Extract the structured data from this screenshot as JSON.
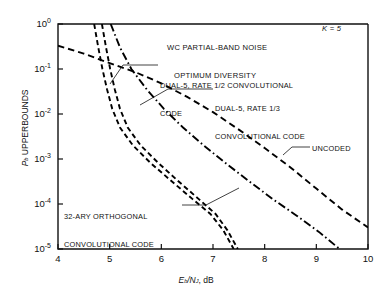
{
  "chart_data": {
    "type": "line",
    "title": "WC PARTIAL-BAND NOISE OPTIMUM DIVERSITY",
    "title_line1": "WC PARTIAL-BAND NOISE",
    "title_line2": "OPTIMUM DIVERSITY",
    "parameter_label": "K = 5",
    "xlabel": "Eb/NJ, dB",
    "xlabel_main": "E",
    "xlabel_sub1": "b",
    "xlabel_slash": "/N",
    "xlabel_sub2": "J",
    "xlabel_units": ", dB",
    "ylabel": "Pb UPPERBOUNDS",
    "ylabel_main": "P",
    "ylabel_sub": "b",
    "ylabel_rest": " UPPERBOUNDS",
    "xlim": [
      4,
      10
    ],
    "ylim": [
      1e-05,
      1
    ],
    "yscale": "log",
    "grid": false,
    "legend_position": "inline-annotations",
    "xticks": [
      "4",
      "5",
      "6",
      "7",
      "8",
      "9",
      "10"
    ],
    "yticks": [
      "10^0",
      "10^-1",
      "10^-2",
      "10^-3",
      "10^-4",
      "10^-5"
    ],
    "ytick_exponents": [
      "0",
      "-1",
      "-2",
      "-3",
      "-4",
      "-5"
    ],
    "ytick_mantissa": "10",
    "series": [
      {
        "name": "32-ARY ORTHOGONAL CONVOLUTIONAL CODE",
        "style": "dashed",
        "color": "#000000",
        "points": [
          [
            4.7,
            1.0
          ],
          [
            4.78,
            0.3
          ],
          [
            4.86,
            0.1
          ],
          [
            4.95,
            0.035
          ],
          [
            5.05,
            0.013
          ],
          [
            5.2,
            0.005
          ],
          [
            5.45,
            0.002
          ],
          [
            5.8,
            0.0008
          ],
          [
            6.2,
            0.00032
          ],
          [
            6.6,
            0.00013
          ],
          [
            6.95,
            6e-05
          ],
          [
            7.2,
            2.6e-05
          ],
          [
            7.4,
            1e-05
          ]
        ]
      },
      {
        "name": "DUAL-5, RATE 1/2 CONVOLUTIONAL CODE",
        "style": "dashed",
        "color": "#000000",
        "points": [
          [
            4.85,
            1.0
          ],
          [
            4.93,
            0.3
          ],
          [
            5.01,
            0.1
          ],
          [
            5.1,
            0.035
          ],
          [
            5.2,
            0.013
          ],
          [
            5.35,
            0.005
          ],
          [
            5.6,
            0.002
          ],
          [
            5.95,
            0.0008
          ],
          [
            6.33,
            0.00032
          ],
          [
            6.72,
            0.00013
          ],
          [
            7.05,
            6e-05
          ],
          [
            7.28,
            2.6e-05
          ],
          [
            7.48,
            1e-05
          ]
        ]
      },
      {
        "name": "DUAL-5, RATE 1/3 CONVOLUTIONAL CODE",
        "style": "dashdot",
        "color": "#000000",
        "points": [
          [
            5.02,
            1.0
          ],
          [
            5.2,
            0.3
          ],
          [
            5.42,
            0.1
          ],
          [
            5.72,
            0.035
          ],
          [
            6.05,
            0.013
          ],
          [
            6.42,
            0.005
          ],
          [
            6.82,
            0.002
          ],
          [
            7.25,
            0.0008
          ],
          [
            7.7,
            0.00032
          ],
          [
            8.15,
            0.00013
          ],
          [
            8.62,
            5.5e-05
          ],
          [
            9.05,
            2.4e-05
          ],
          [
            9.45,
            1e-05
          ]
        ]
      },
      {
        "name": "UNCODED",
        "style": "dashed-long",
        "color": "#000000",
        "points": [
          [
            4.0,
            0.33
          ],
          [
            4.5,
            0.22
          ],
          [
            5.0,
            0.135
          ],
          [
            5.5,
            0.085
          ],
          [
            6.0,
            0.048
          ],
          [
            6.5,
            0.024
          ],
          [
            7.0,
            0.011
          ],
          [
            7.5,
            0.0045
          ],
          [
            8.0,
            0.00175
          ],
          [
            8.5,
            0.00065
          ],
          [
            9.0,
            0.00022
          ],
          [
            9.5,
            7.5e-05
          ],
          [
            10.0,
            3e-05
          ]
        ]
      }
    ],
    "annotations": [
      {
        "id": "ann-rate-half",
        "line1": "DUAL-5, RATE 1/2 CONVOLUTIONAL",
        "line2": "CODE"
      },
      {
        "id": "ann-rate-third",
        "line1": "DUAL-5, RATE 1/3",
        "line2": "CONVOLUTIONAL CODE"
      },
      {
        "id": "ann-uncoded",
        "line1": "UNCODED",
        "line2": ""
      },
      {
        "id": "ann-32ary",
        "line1": "32-ARY ORTHOGONAL",
        "line2": "CONVOLUTIONAL CODE"
      }
    ]
  }
}
